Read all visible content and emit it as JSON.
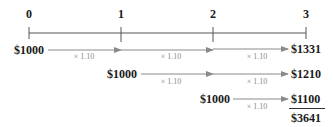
{
  "colors": {
    "text": "#1a1a1a",
    "timeline": "#555555",
    "arrow": "#8a8a8a",
    "multiplier": "#8a8a8a"
  },
  "timeline": {
    "periods": [
      {
        "label": "0",
        "x": 29
      },
      {
        "label": "1",
        "x": 121
      },
      {
        "label": "2",
        "x": 213
      },
      {
        "label": "3",
        "x": 306
      }
    ]
  },
  "rows": [
    {
      "start_amount": "$1000",
      "start_period": 0,
      "multipliers": [
        "× 1.10",
        "× 1.10",
        "× 1.10"
      ],
      "end_amount": "$1331"
    },
    {
      "start_amount": "$1000",
      "start_period": 1,
      "multipliers": [
        "× 1.10",
        "× 1.10"
      ],
      "end_amount": "$1210"
    },
    {
      "start_amount": "$1000",
      "start_period": 2,
      "multipliers": [
        "× 1.10"
      ],
      "end_amount": "$1100"
    }
  ],
  "total": "$3641"
}
